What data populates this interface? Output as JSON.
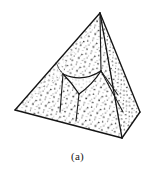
{
  "figure": {
    "caption": "(a)",
    "alt_label": "tetrahedron-with-internal-curved-cavity",
    "shape_name": "tetrahedron",
    "rendering_style": "stippled line drawing",
    "colors": {
      "background": "#ffffff",
      "outline": "#141414",
      "stipple": "#2b2b2b",
      "fill": "#ffffff",
      "caption_text": "#171717"
    },
    "vertices": {
      "apex": {
        "label": "apex",
        "x": 100,
        "y": 13
      },
      "left": {
        "label": "left-base",
        "x": 15,
        "y": 110
      },
      "front": {
        "label": "front-base",
        "x": 122,
        "y": 138
      },
      "right": {
        "label": "right-base",
        "x": 140,
        "y": 112
      }
    },
    "inner_cavity": {
      "label": "concave-curved-triangle",
      "corner_top_left": {
        "x": 63,
        "y": 74
      },
      "corner_top_right": {
        "x": 101,
        "y": 71
      },
      "corner_bottom": {
        "x": 79,
        "y": 94
      },
      "curvature": "concave"
    },
    "internal_edges": [
      {
        "name": "apex-to-cavity-top-right",
        "from": "apex",
        "to": "corner_top_right"
      },
      {
        "name": "cavity-top-left-to-left-base",
        "from": "corner_top_left",
        "to": "left_base_edge"
      },
      {
        "name": "cavity-bottom-to-front-base",
        "from": "corner_bottom",
        "to": "front_base_edge"
      },
      {
        "name": "cavity-top-right-to-right-base",
        "from": "corner_top_right",
        "to": "right_base_edge"
      }
    ],
    "outline_edges": [
      {
        "name": "apex-left",
        "from": "apex",
        "to": "left"
      },
      {
        "name": "apex-right",
        "from": "apex",
        "to": "right"
      },
      {
        "name": "apex-front",
        "from": "apex",
        "to": "front"
      },
      {
        "name": "left-front",
        "from": "left",
        "to": "front"
      },
      {
        "name": "front-right",
        "from": "front",
        "to": "right"
      }
    ]
  }
}
